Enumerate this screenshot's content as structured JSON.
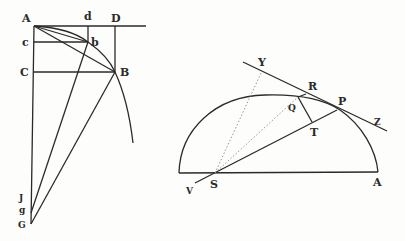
{
  "figure_left": {
    "title": "Curve and chord construction",
    "labels": {
      "A": "A",
      "d": "d",
      "D": "D",
      "c": "c",
      "b": "b",
      "C": "C",
      "B": "B",
      "J": "J",
      "g": "g",
      "G": "G"
    }
  },
  "figure_right": {
    "title": "Ellipse with focus S and tangent at P",
    "labels": {
      "Y": "Y",
      "R": "R",
      "Q": "Q",
      "P": "P",
      "Z": "Z",
      "T": "T",
      "V": "V",
      "S": "S",
      "A": "A"
    }
  },
  "colors": {
    "ink": "#2a2a2a",
    "paper": "#fdfdfb",
    "dotted": "#8a8a8a"
  }
}
